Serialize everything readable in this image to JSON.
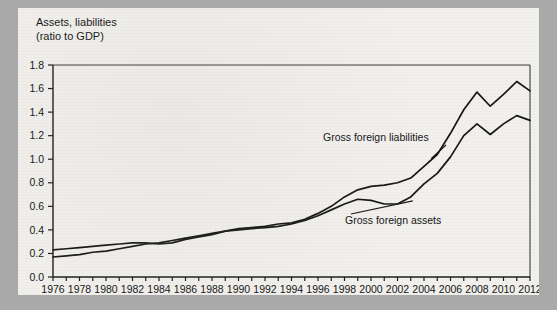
{
  "figure": {
    "title_line1": "Assets, liabilities",
    "title_line2": "(ratio to GDP)"
  },
  "chart_data": {
    "type": "line",
    "title": "Assets, liabilities (ratio to GDP)",
    "xlabel": "",
    "ylabel": "Assets, liabilities (ratio to GDP)",
    "xlim": [
      1976,
      2012
    ],
    "ylim": [
      0.0,
      1.8
    ],
    "grid": false,
    "legend_position": "inline-annotations",
    "ytick_labels": [
      "0.0",
      "0.2",
      "0.4",
      "0.6",
      "0.8",
      "1.0",
      "1.2",
      "1.4",
      "1.6",
      "1.8"
    ],
    "ytick_values": [
      0.0,
      0.2,
      0.4,
      0.6,
      0.8,
      1.0,
      1.2,
      1.4,
      1.6,
      1.8
    ],
    "xtick_labels": [
      "1976",
      "1978",
      "1980",
      "1982",
      "1984",
      "1986",
      "1988",
      "1990",
      "1992",
      "1994",
      "1996",
      "1998",
      "2000",
      "2002",
      "2004",
      "2006",
      "2008",
      "2010",
      "2012"
    ],
    "xtick_values": [
      1976,
      1978,
      1980,
      1982,
      1984,
      1986,
      1988,
      1990,
      1992,
      1994,
      1996,
      1998,
      2000,
      2002,
      2004,
      2006,
      2008,
      2010,
      2012
    ],
    "x": [
      1976,
      1977,
      1978,
      1979,
      1980,
      1981,
      1982,
      1983,
      1984,
      1985,
      1986,
      1987,
      1988,
      1989,
      1990,
      1991,
      1992,
      1993,
      1994,
      1995,
      1996,
      1997,
      1998,
      1999,
      2000,
      2001,
      2002,
      2003,
      2004,
      2005,
      2006,
      2007,
      2008,
      2009,
      2010,
      2011,
      2012
    ],
    "series": [
      {
        "name": "Gross foreign liabilities",
        "values": [
          0.23,
          0.24,
          0.25,
          0.26,
          0.27,
          0.28,
          0.29,
          0.29,
          0.28,
          0.29,
          0.32,
          0.34,
          0.36,
          0.39,
          0.41,
          0.42,
          0.43,
          0.45,
          0.46,
          0.49,
          0.54,
          0.6,
          0.68,
          0.74,
          0.77,
          0.78,
          0.8,
          0.84,
          0.94,
          1.04,
          1.22,
          1.42,
          1.57,
          1.45,
          1.55,
          1.66,
          1.58
        ]
      },
      {
        "name": "Gross foreign assets",
        "values": [
          0.17,
          0.18,
          0.19,
          0.21,
          0.22,
          0.24,
          0.26,
          0.28,
          0.29,
          0.31,
          0.33,
          0.35,
          0.37,
          0.39,
          0.4,
          0.41,
          0.42,
          0.43,
          0.45,
          0.48,
          0.52,
          0.57,
          0.62,
          0.66,
          0.65,
          0.62,
          0.62,
          0.68,
          0.79,
          0.88,
          1.02,
          1.2,
          1.3,
          1.21,
          1.3,
          1.37,
          1.33
        ]
      }
    ],
    "annotations": [
      {
        "text": "Gross foreign liabilities",
        "series": "Gross foreign liabilities"
      },
      {
        "text": "Gross foreign assets",
        "series": "Gross foreign assets"
      }
    ]
  }
}
